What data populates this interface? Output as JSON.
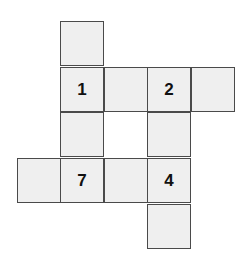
{
  "puzzle": {
    "type": "cross-shaped grid net",
    "fill_color": "#efefef",
    "border_color": "#4a4a4a",
    "cells": [
      {
        "col": 1,
        "row": 0,
        "label": ""
      },
      {
        "col": 1,
        "row": 1,
        "label": "1"
      },
      {
        "col": 2,
        "row": 1,
        "label": ""
      },
      {
        "col": 3,
        "row": 1,
        "label": "2"
      },
      {
        "col": 4,
        "row": 1,
        "label": ""
      },
      {
        "col": 1,
        "row": 2,
        "label": ""
      },
      {
        "col": 3,
        "row": 2,
        "label": ""
      },
      {
        "col": 0,
        "row": 3,
        "label": ""
      },
      {
        "col": 1,
        "row": 3,
        "label": "7"
      },
      {
        "col": 2,
        "row": 3,
        "label": ""
      },
      {
        "col": 3,
        "row": 3,
        "label": "4"
      },
      {
        "col": 3,
        "row": 4,
        "label": ""
      }
    ]
  }
}
